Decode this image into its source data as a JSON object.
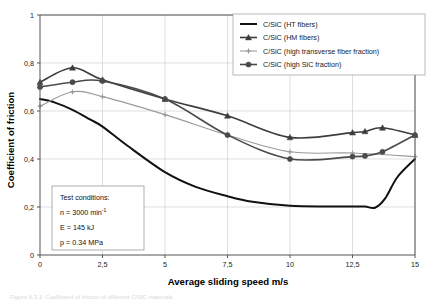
{
  "figure": {
    "caption": "Figure 6.3.1: Coefficient of friction of different C/SiC materials"
  },
  "chart_data": {
    "type": "line",
    "title": "",
    "xlabel": "Average sliding speed m/s",
    "ylabel": "Coefficient of friction",
    "xlim": [
      0,
      15
    ],
    "ylim": [
      0,
      1
    ],
    "grid": true,
    "legend_position": "top-right",
    "xticks": [
      0,
      2.5,
      5,
      7.5,
      10,
      12.5,
      15
    ],
    "xticklabels": [
      "0",
      "2,5",
      "5",
      "7,5",
      "10",
      "12,5",
      "15"
    ],
    "yticks": [
      0,
      0.2,
      0.4,
      0.6,
      0.8,
      1
    ],
    "yticklabels": [
      "0",
      "0,2",
      "0,4",
      "0,6",
      "0,8",
      "1"
    ],
    "series": [
      {
        "name": "C/SiC (HT fibers)",
        "marker": "none",
        "color": "#111111",
        "width": 2.0,
        "x": [
          0,
          0.6,
          1.3,
          2.0,
          2.5,
          3.5,
          5.0,
          6.2,
          7.5,
          8.5,
          10.0,
          11.5,
          12.5,
          13.0,
          13.4,
          13.8,
          14.3,
          15.0
        ],
        "y": [
          0.65,
          0.635,
          0.605,
          0.565,
          0.535,
          0.455,
          0.345,
          0.285,
          0.245,
          0.222,
          0.205,
          0.202,
          0.202,
          0.202,
          0.197,
          0.235,
          0.325,
          0.4
        ]
      },
      {
        "name": "C/SiC (HM fibers)",
        "marker": "triangle",
        "color": "#3d3d3d",
        "width": 1.6,
        "x": [
          0,
          1.3,
          2.5,
          5.0,
          7.5,
          10.0,
          12.5,
          13.0,
          13.7,
          15.0
        ],
        "y": [
          0.72,
          0.78,
          0.73,
          0.65,
          0.58,
          0.49,
          0.51,
          0.515,
          0.53,
          0.5
        ]
      },
      {
        "name": "C/SiC (high transverse fiber fraction)",
        "marker": "plus",
        "color": "#9a9a9a",
        "width": 1.1,
        "x": [
          0,
          1.3,
          2.5,
          5.0,
          7.5,
          10.0,
          12.5,
          15.0
        ],
        "y": [
          0.62,
          0.68,
          0.66,
          0.585,
          0.5,
          0.43,
          0.425,
          0.41
        ]
      },
      {
        "name": "C/SiC (high SiC fraction)",
        "marker": "circle",
        "color": "#4a4a4a",
        "width": 1.6,
        "x": [
          0,
          1.3,
          2.5,
          5.0,
          7.5,
          10.0,
          12.5,
          13.0,
          13.7,
          15.0
        ],
        "y": [
          0.7,
          0.72,
          0.725,
          0.65,
          0.5,
          0.4,
          0.41,
          0.413,
          0.43,
          0.5
        ]
      }
    ],
    "annotation_box": {
      "lines": [
        {
          "text": "Test conditions:",
          "sup": ""
        },
        {
          "text": "n = 3000 min",
          "sup": "-1"
        },
        {
          "text": "E = 145 kJ",
          "sup": ""
        },
        {
          "text": "p = 0.34 MPa",
          "sup": ""
        }
      ]
    }
  }
}
